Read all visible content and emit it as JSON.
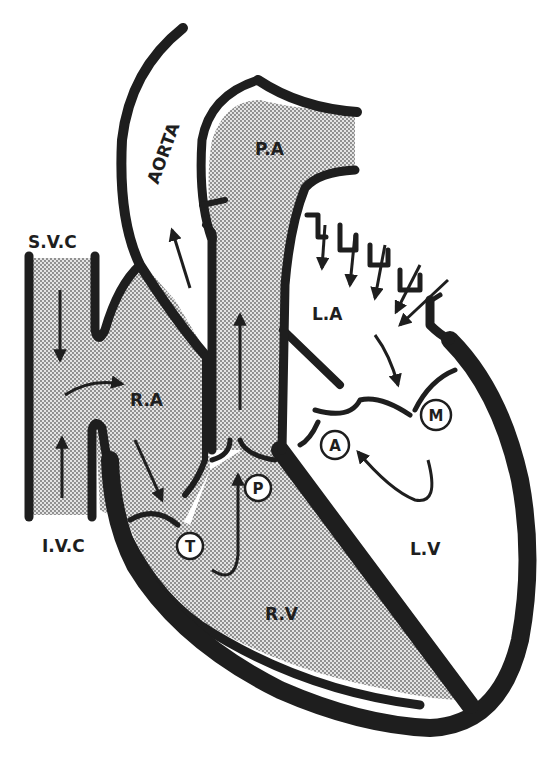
{
  "diagram": {
    "type": "heart-blood-flow",
    "colors": {
      "wall": "#1e1e1e",
      "deoxygenated_fill_dots": "#6e6e6e",
      "deoxygenated_fill_bg": "#e2e2e2",
      "oxygenated_fill": "#ffffff",
      "background": "#ffffff"
    },
    "labels": {
      "svc": "S.V.C",
      "ivc": "I.V.C",
      "ra": "R.A",
      "rv": "R.V",
      "la": "L.A",
      "lv": "L.V",
      "aorta": "AORTA",
      "pa": "P.A"
    },
    "valves": {
      "tricuspid": "T",
      "pulmonary": "P",
      "mitral": "M",
      "aortic": "A"
    }
  }
}
